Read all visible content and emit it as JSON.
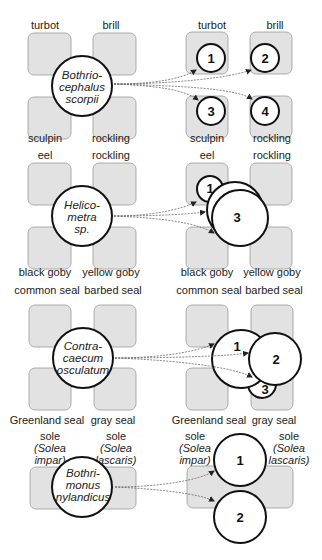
{
  "rows": [
    {
      "parasite": [
        "Bothrio-",
        "cephalus",
        "scorpii"
      ],
      "hosts": [
        "turbot",
        "brill",
        "sculpin",
        "rockling"
      ],
      "clusters": [
        "1",
        "2",
        "3",
        "4"
      ]
    },
    {
      "parasite": [
        "Helico-",
        "metra",
        "sp."
      ],
      "hosts": [
        "eel",
        "rockling",
        "black goby",
        "yellow goby"
      ],
      "clusters": [
        "1",
        "3"
      ]
    },
    {
      "parasite": [
        "Contra-",
        "caecum",
        "osculatum"
      ],
      "hosts": [
        "common seal",
        "barbed seal",
        "Greenland seal",
        "gray seal"
      ],
      "clusters": [
        "1",
        "2",
        "3"
      ]
    },
    {
      "parasite": [
        "Bothri-",
        "monus",
        "nylandicus"
      ],
      "hosts": [
        {
          "common": "sole",
          "latin1": "(Solea",
          "latin2": "impar)"
        },
        {
          "common": "sole",
          "latin1": "(Solea",
          "latin2": "lascaris)"
        }
      ],
      "clusters": [
        "1",
        "2"
      ]
    }
  ],
  "colors": {
    "host_box_fill": "#e2e2e2",
    "host_box_stroke": "#9a9a9a",
    "circle_stroke": "#111111",
    "arrow": "#555555"
  }
}
